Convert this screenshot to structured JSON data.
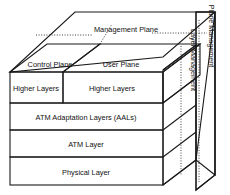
{
  "diagram": {
    "type": "3d-layered-cube",
    "colors": {
      "user_plane_fill": "#a9a9a9",
      "user_plane_side": "#8f8f8f",
      "user_plane_top": "#c4c4c4",
      "plain_fill": "#ffffff",
      "edge": "#1a1a1a",
      "text": "#111111"
    }
  },
  "planes": {
    "management_plane": {
      "label": "Management Plane",
      "shaded": false
    },
    "control_plane": {
      "label": "Control Plane",
      "shaded": false
    },
    "user_plane": {
      "label": "User Plane",
      "shaded": true
    }
  },
  "layers": [
    {
      "id": "higher-layers-control",
      "label": "Higher Layers",
      "plane": "control",
      "shaded": false,
      "full_width": false
    },
    {
      "id": "higher-layers-user",
      "label": "Higher Layers",
      "plane": "user",
      "shaded": true,
      "full_width": false
    },
    {
      "id": "aal",
      "label": "ATM Adaptation Layers (AALs)",
      "plane": "both",
      "shaded": false,
      "full_width": true
    },
    {
      "id": "atm",
      "label": "ATM Layer",
      "plane": "both",
      "shaded": false,
      "full_width": true
    },
    {
      "id": "physical",
      "label": "Physical Layer",
      "plane": "both",
      "shaded": false,
      "full_width": true
    }
  ],
  "side_labels": {
    "plane_management": "Plane Management",
    "layer_management": "Layer Management"
  }
}
